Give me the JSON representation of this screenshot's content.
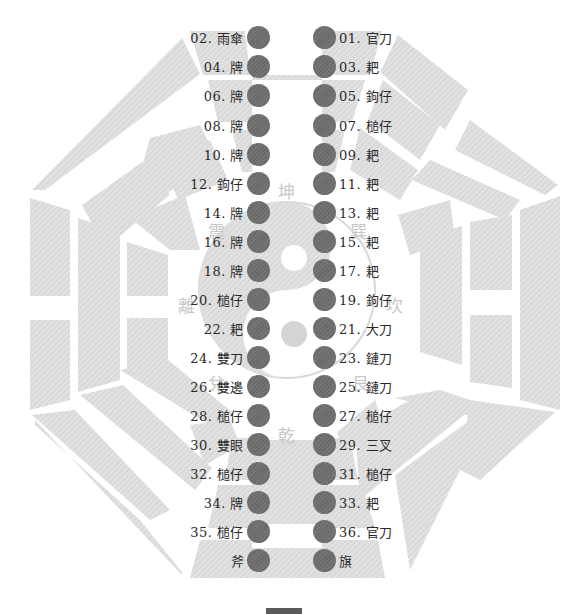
{
  "diagram": {
    "title": "",
    "colors": {
      "panel_fill": "#d9d9d9",
      "panel_stripe": "#e8e8e8",
      "dot_fill": "#6b6b6b",
      "label_text": "#2a2a2a",
      "trigram_text": "#c8c8c8",
      "taiji_fill": "#dadada"
    },
    "trigram_labels": {
      "top": "坤",
      "bottom": "乾",
      "left": "離",
      "right": "坎",
      "top_left": "震",
      "top_right": "巽",
      "bottom_left": "兌",
      "bottom_right": "艮"
    },
    "left_column": [
      {
        "label": "02. 雨傘"
      },
      {
        "label": "04. 牌"
      },
      {
        "label": "06. 牌"
      },
      {
        "label": "08. 牌"
      },
      {
        "label": "10. 牌"
      },
      {
        "label": "12. 鉤仔"
      },
      {
        "label": "14. 牌"
      },
      {
        "label": "16. 牌"
      },
      {
        "label": "18. 牌"
      },
      {
        "label": "20. 槌仔"
      },
      {
        "label": "22. 耙"
      },
      {
        "label": "24. 雙刀"
      },
      {
        "label": "26. 雙邊"
      },
      {
        "label": "28. 槌仔"
      },
      {
        "label": "30. 雙眼"
      },
      {
        "label": "32. 槌仔"
      },
      {
        "label": "34. 牌"
      },
      {
        "label": "35. 槌仔"
      },
      {
        "label": "斧"
      }
    ],
    "right_column": [
      {
        "label": "01. 官刀"
      },
      {
        "label": "03. 耙"
      },
      {
        "label": "05. 鉤仔"
      },
      {
        "label": "07. 槌仔"
      },
      {
        "label": "09. 耙"
      },
      {
        "label": "11. 耙"
      },
      {
        "label": "13. 耙"
      },
      {
        "label": "15. 耙"
      },
      {
        "label": "17. 耙"
      },
      {
        "label": "19. 鉤仔"
      },
      {
        "label": "21. 大刀"
      },
      {
        "label": "23. 鏈刀"
      },
      {
        "label": "25. 鏈刀"
      },
      {
        "label": "27. 槌仔"
      },
      {
        "label": "29. 三叉"
      },
      {
        "label": "31. 槌仔"
      },
      {
        "label": "33. 耙"
      },
      {
        "label": "36. 官刀"
      },
      {
        "label": "旗"
      }
    ]
  }
}
